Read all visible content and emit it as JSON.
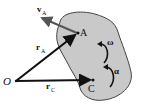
{
  "diagram": {
    "colors": {
      "body_fill": "#c9c9c9",
      "body_stroke": "#444444",
      "vector": "#111111",
      "velocity": "#555555"
    },
    "points": {
      "O": {
        "label": "O",
        "x": 16,
        "y": 81
      },
      "A": {
        "label": "A",
        "x": 78,
        "y": 33
      },
      "C": {
        "label": "C",
        "x": 93,
        "y": 80
      }
    },
    "vectors": {
      "r_A": {
        "label": "r",
        "sub": "A"
      },
      "r_C": {
        "label": "r",
        "sub": "C"
      },
      "v_A": {
        "label": "v",
        "sub": "A"
      }
    },
    "angular": {
      "omega": {
        "label": "ω"
      },
      "alpha": {
        "label": "α"
      }
    }
  }
}
